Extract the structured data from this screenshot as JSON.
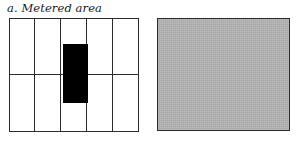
{
  "figure": {
    "panels": [
      {
        "id": "a",
        "caption": "a. Metered area",
        "type": "grid-diagram",
        "grid": {
          "columns": 5,
          "rows": 2,
          "line_color": "#2b2b2b",
          "cell_fill": "#ffffff"
        },
        "highlight": {
          "name": "metered-patch",
          "color": "#000000",
          "column_index": 3,
          "description": "solid black vertical patch covering the centre column"
        }
      },
      {
        "id": "b",
        "caption": "b. Average tone",
        "type": "tone-swatch",
        "swatch": {
          "name": "average-tone-swatch",
          "fill": "#b3b3b3",
          "border_color": "#2b2b2b"
        }
      }
    ],
    "colors": {
      "ink": "#2b2b2b",
      "black": "#000000",
      "paper": "#ffffff",
      "mid_gray": "#b3b3b3"
    }
  }
}
